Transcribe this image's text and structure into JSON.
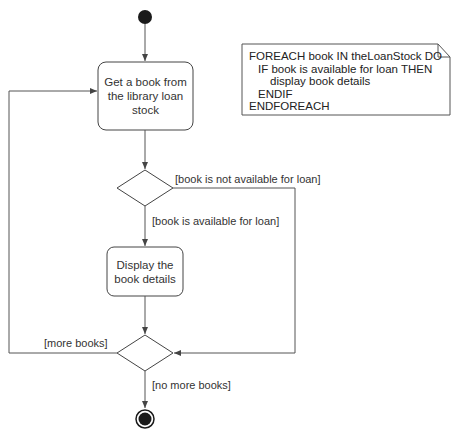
{
  "diagram": {
    "type": "UML activity diagram",
    "nodes": {
      "start": {
        "kind": "initial-node"
      },
      "activity_get_book": {
        "kind": "action",
        "label": "Get a book from the library loan stock",
        "lines": [
          "Get a book from",
          "the library loan",
          "stock"
        ]
      },
      "decision_availability": {
        "kind": "decision"
      },
      "activity_display": {
        "kind": "action",
        "label": "Display the book details",
        "lines": [
          "Display the",
          "book details"
        ]
      },
      "merge_decision_more": {
        "kind": "merge/decision"
      },
      "end": {
        "kind": "final-node"
      }
    },
    "guards": {
      "not_available": "[book is not available for loan]",
      "available": "[book is available for loan]",
      "more_books": "[more books]",
      "no_more_books": "[no more books]"
    },
    "note": {
      "lines": [
        "FOREACH book IN theLoanStock DO",
        "  IF book is available for loan THEN",
        "      display book details",
        "  ENDIF",
        "ENDFOREACH"
      ]
    },
    "colors": {
      "line": "#555555",
      "node_fill": "#1a1a1a",
      "box_border": "#444444"
    }
  }
}
